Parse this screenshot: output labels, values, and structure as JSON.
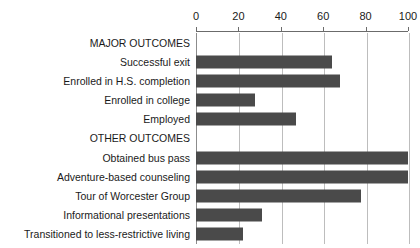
{
  "chart_data": {
    "type": "bar",
    "orientation": "horizontal",
    "title": "",
    "subtitle": "",
    "xlabel": "",
    "ylabel": "",
    "xlim": [
      0,
      100
    ],
    "xticks": [
      0,
      20,
      40,
      60,
      80,
      100
    ],
    "xtick_labels": [
      "0",
      "20",
      "40",
      "60",
      "80",
      "100"
    ],
    "grid": "vertical",
    "legend": "none",
    "axis_position": "top",
    "bar_color": "#4a4a4a",
    "gridline_color": "#bdbdbd",
    "axis_color": "#8c8c8c",
    "categories": [
      "MAJOR OUTCOMES",
      "Successful exit",
      "Enrolled in H.S. completion",
      "Enrolled in college",
      "Employed",
      "OTHER OUTCOMES",
      "Obtained bus pass",
      "Adventure-based counseling",
      "Tour of Worcester Group",
      "Informational presentations",
      "Transitioned to less-restrictive living"
    ],
    "values": [
      null,
      64,
      68,
      28,
      47,
      null,
      100,
      100,
      78,
      31,
      22
    ],
    "group_headers": [
      "MAJOR OUTCOMES",
      "OTHER OUTCOMES"
    ],
    "rows": [
      {
        "label": "MAJOR OUTCOMES",
        "value": null,
        "is_header": true
      },
      {
        "label": "Successful exit",
        "value": 64,
        "is_header": false
      },
      {
        "label": "Enrolled in H.S. completion",
        "value": 68,
        "is_header": false
      },
      {
        "label": "Enrolled in college",
        "value": 28,
        "is_header": false
      },
      {
        "label": "Employed",
        "value": 47,
        "is_header": false
      },
      {
        "label": "OTHER OUTCOMES",
        "value": null,
        "is_header": true
      },
      {
        "label": "Obtained bus pass",
        "value": 100,
        "is_header": false
      },
      {
        "label": "Adventure-based counseling",
        "value": 100,
        "is_header": false
      },
      {
        "label": "Tour of Worcester Group",
        "value": 78,
        "is_header": false
      },
      {
        "label": "Informational presentations",
        "value": 31,
        "is_header": false
      },
      {
        "label": "Transitioned to less-restrictive living",
        "value": 22,
        "is_header": false
      }
    ]
  },
  "layout": {
    "plot_left_px": 196,
    "plot_right_px": 408,
    "plot_top_px": 33,
    "plot_bottom_px": 244
  }
}
